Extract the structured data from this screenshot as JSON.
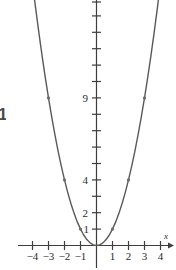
{
  "figure": {
    "side_label": "1",
    "curve_color": "#595959",
    "axis_color": "#3d3d3d",
    "point_color": "#6b6b6b",
    "background": "#ffffff"
  },
  "chart_data": {
    "type": "line",
    "title": "",
    "subtitle": "",
    "xlabel": "x",
    "ylabel": "",
    "function": "y = x^2",
    "grid": false,
    "legend": null,
    "xlim": [
      -4.7,
      4.7
    ],
    "ylim": [
      -0.6,
      15.5
    ],
    "xticks": [
      -4,
      -3,
      -2,
      -1,
      1,
      2,
      3,
      4
    ],
    "xtick_labels": [
      "−4",
      "−3",
      "−2",
      "−1",
      "1",
      "2",
      "3",
      "4"
    ],
    "yticks": [
      1,
      2,
      3,
      4,
      5,
      6,
      7,
      8,
      9,
      10,
      11,
      12,
      13,
      14,
      15
    ],
    "ytick_labels_shown": {
      "1": "1",
      "2": "2",
      "4": "4",
      "9": "9"
    },
    "series": [
      {
        "name": "y = x^2",
        "x": [
          -3.95,
          -3.8,
          -3.6,
          -3.4,
          -3.2,
          -3,
          -2.8,
          -2.6,
          -2.4,
          -2.2,
          -2,
          -1.8,
          -1.6,
          -1.4,
          -1.2,
          -1,
          -0.8,
          -0.6,
          -0.4,
          -0.2,
          0,
          0.2,
          0.4,
          0.6,
          0.8,
          1,
          1.2,
          1.4,
          1.6,
          1.8,
          2,
          2.2,
          2.4,
          2.6,
          2.8,
          3,
          3.2,
          3.4,
          3.6,
          3.8,
          3.95
        ],
        "y": [
          15.6,
          14.44,
          12.96,
          11.56,
          10.24,
          9,
          7.84,
          6.76,
          5.76,
          4.84,
          4,
          3.24,
          2.56,
          1.96,
          1.44,
          1,
          0.64,
          0.36,
          0.16,
          0.04,
          0,
          0.04,
          0.16,
          0.36,
          0.64,
          1,
          1.44,
          1.96,
          2.56,
          3.24,
          4,
          4.84,
          5.76,
          6.76,
          7.84,
          9,
          10.24,
          11.56,
          12.96,
          14.44,
          15.6
        ]
      }
    ],
    "marked_points": [
      {
        "x": -3,
        "y": 9
      },
      {
        "x": -2,
        "y": 4
      },
      {
        "x": -1,
        "y": 1
      },
      {
        "x": 1,
        "y": 1
      },
      {
        "x": 2,
        "y": 4
      },
      {
        "x": 3,
        "y": 9
      }
    ],
    "axis_arrow_label": "x"
  }
}
